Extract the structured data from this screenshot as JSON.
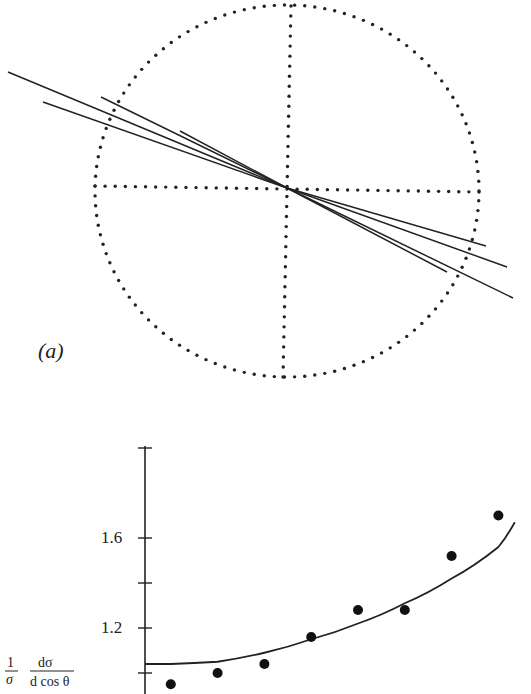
{
  "panel_a": {
    "label": "(a)",
    "circle": {
      "cx": 287,
      "cy": 191,
      "rx": 192,
      "ry": 186,
      "dot_spacing": 10
    },
    "crosshair": {
      "horizontal": {
        "x1": 95,
        "y1": 186,
        "x2": 479,
        "y2": 192
      },
      "vertical": {
        "x1": 291,
        "y1": 6,
        "x2": 283,
        "y2": 377
      }
    },
    "vertex": {
      "x": 287,
      "y": 188
    },
    "tracks": [
      {
        "start": [
          8,
          72
        ],
        "end": [
          513,
          298
        ]
      },
      {
        "start": [
          43,
          102
        ],
        "end": [
          486,
          246
        ]
      },
      {
        "start": [
          101,
          97
        ],
        "end": [
          507,
          267
        ]
      },
      {
        "start": [
          180,
          131
        ],
        "end": [
          447,
          272
        ]
      }
    ]
  },
  "chart_data": {
    "type": "scatter",
    "title": "",
    "xlabel": "",
    "ylabel": "1/σ dσ/d cos θ",
    "ylabel_parts": {
      "numerator_left": "1",
      "denominator_left": "σ",
      "numerator_right": "dσ",
      "denominator_right": "d cos θ"
    },
    "y_tick_labels": [
      "1.2",
      "1.6"
    ],
    "y_ticks": [
      1.0,
      1.2,
      1.4,
      1.6,
      2.0
    ],
    "ylim": [
      0.9,
      2.0
    ],
    "grid": false,
    "series": [
      {
        "name": "data points",
        "kind": "scatter",
        "x": [
          1,
          2,
          3,
          4,
          5,
          6,
          7,
          8
        ],
        "values": [
          0.95,
          1.0,
          1.04,
          1.16,
          1.28,
          1.28,
          1.52,
          1.7
        ]
      },
      {
        "name": "fit curve",
        "kind": "line",
        "x": [
          0,
          1,
          2,
          3,
          4,
          5,
          6,
          7,
          8,
          8.35
        ],
        "values": [
          1.04,
          1.04,
          1.05,
          1.09,
          1.15,
          1.22,
          1.31,
          1.42,
          1.56,
          1.67
        ]
      }
    ]
  }
}
